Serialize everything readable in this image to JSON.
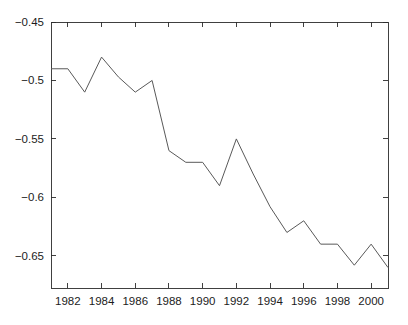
{
  "chart_data": {
    "type": "line",
    "title": "",
    "subtitle": "",
    "xlabel": "",
    "ylabel": "",
    "xlim": [
      1981,
      2001
    ],
    "ylim": [
      -0.6775,
      -0.45
    ],
    "grid": false,
    "legend": null,
    "legend_position": "none",
    "line_color": "#595959",
    "axis_color": "#2b2b2b",
    "background_color": "#ffffff",
    "x": [
      1981,
      1982,
      1983,
      1984,
      1985,
      1986,
      1987,
      1988,
      1989,
      1990,
      1991,
      1992,
      1993,
      1994,
      1995,
      1996,
      1997,
      1998,
      1999,
      2000,
      2001
    ],
    "values": [
      -0.49,
      -0.49,
      -0.51,
      -0.48,
      -0.497,
      -0.51,
      -0.5,
      -0.56,
      -0.57,
      -0.57,
      -0.59,
      -0.55,
      -0.58,
      -0.608,
      -0.63,
      -0.62,
      -0.64,
      -0.64,
      -0.658,
      -0.64,
      -0.66
    ],
    "series": [
      {
        "name": "series-1",
        "values": [
          -0.49,
          -0.49,
          -0.51,
          -0.48,
          -0.497,
          -0.51,
          -0.5,
          -0.56,
          -0.57,
          -0.57,
          -0.59,
          -0.55,
          -0.58,
          -0.608,
          -0.63,
          -0.62,
          -0.64,
          -0.64,
          -0.658,
          -0.64,
          -0.66
        ]
      }
    ],
    "xticks": [
      1982,
      1984,
      1986,
      1988,
      1990,
      1992,
      1994,
      1996,
      1998,
      2000
    ],
    "xtick_labels": [
      "1982",
      "1984",
      "1986",
      "1988",
      "1990",
      "1992",
      "1994",
      "1996",
      "1998",
      "2000"
    ],
    "yticks": [
      -0.45,
      -0.5,
      -0.55,
      -0.6,
      -0.65
    ],
    "ytick_labels": [
      "−0.45",
      "−0.5",
      "−0.55",
      "−0.6",
      "−0.65"
    ]
  }
}
